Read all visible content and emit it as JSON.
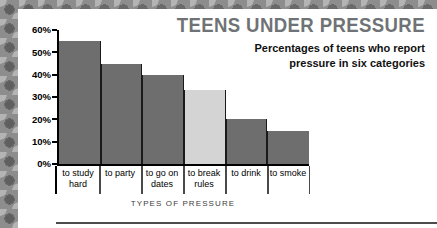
{
  "title": "TEENS UNDER PRESSURE",
  "subtitle_line1": "Percentages of teens who report",
  "subtitle_line2": "pressure in six categories",
  "axis_title": "TYPES OF PRESSURE",
  "colors": {
    "bar_dark": "#6e6e6e",
    "bar_light": "#d4d4d4",
    "title_gray": "#6f7375",
    "border_gray": "#8d8d8d",
    "axis_black": "#000000"
  },
  "chart_data": {
    "type": "bar",
    "title": "TEENS UNDER PRESSURE",
    "subtitle": "Percentages of teens who report pressure in six categories",
    "xlabel": "TYPES OF PRESSURE",
    "ylabel": "",
    "ylim": [
      0,
      60
    ],
    "ytick_labels": [
      "60%",
      "50%",
      "40%",
      "30%",
      "20%",
      "10%",
      "0%"
    ],
    "ytick_values": [
      60,
      50,
      40,
      30,
      20,
      10,
      0
    ],
    "grid": false,
    "legend": null,
    "categories": [
      "to study hard",
      "to party",
      "to go on dates",
      "to break rules",
      "to drink",
      "to smoke"
    ],
    "category_lines": [
      [
        "to study",
        "hard"
      ],
      [
        "to party",
        ""
      ],
      [
        "to go on",
        "dates"
      ],
      [
        "to break",
        "rules"
      ],
      [
        "to drink",
        ""
      ],
      [
        "to smoke",
        ""
      ]
    ],
    "values": [
      55,
      45,
      40,
      33,
      20,
      15
    ],
    "bar_colors": [
      "#6e6e6e",
      "#6e6e6e",
      "#6e6e6e",
      "#d4d4d4",
      "#6e6e6e",
      "#6e6e6e"
    ]
  }
}
